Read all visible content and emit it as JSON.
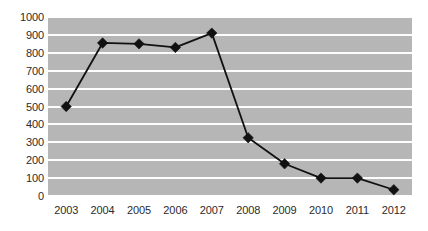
{
  "chart_data": {
    "type": "line",
    "title": "",
    "xlabel": "",
    "ylabel": "",
    "categories": [
      "2003",
      "2004",
      "2005",
      "2006",
      "2007",
      "2008",
      "2009",
      "2010",
      "2011",
      "2012"
    ],
    "values": [
      500,
      855,
      850,
      830,
      910,
      325,
      180,
      100,
      100,
      35
    ],
    "series": [
      {
        "name": "Series 1",
        "values": [
          500,
          855,
          850,
          830,
          910,
          325,
          180,
          100,
          100,
          35
        ]
      }
    ],
    "ylim": [
      0,
      1000
    ],
    "ytick_values": [
      0,
      100,
      200,
      300,
      400,
      500,
      600,
      700,
      800,
      900,
      1000
    ],
    "ytick_labels": [
      "0",
      "100",
      "200",
      "300",
      "400",
      "500",
      "600",
      "700",
      "800",
      "900",
      "1000"
    ],
    "xtick_labels": [
      "2003",
      "2004",
      "2005",
      "2006",
      "2007",
      "2008",
      "2009",
      "2010",
      "2011",
      "2012"
    ],
    "grid": true,
    "grid_axis": "y",
    "legend": false,
    "legend_position": "none",
    "annotations": [],
    "marker": "diamond",
    "colors": {
      "plot_background": "#b6b6b6",
      "gridline": "#fdfdfd",
      "line": "#111111",
      "marker": "#111111",
      "tick_label": "#2b2b2b",
      "page_background": "#ffffff"
    }
  }
}
